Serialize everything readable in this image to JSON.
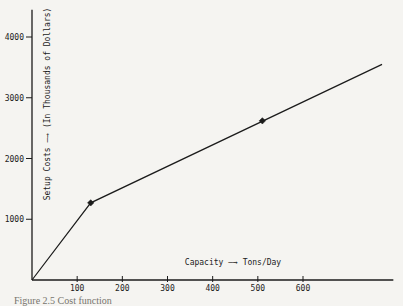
{
  "page": {
    "background": "#f5f4f1",
    "ink": "#1b1b1b"
  },
  "caption": {
    "text": "Figure 2.5 Cost function"
  },
  "chart_data": {
    "type": "line",
    "title": "",
    "xlabel": "Capacity —→ Tons/Day",
    "ylabel": "Setup Costs —→ (In Thousands of Dollars)",
    "x_ticks": [
      100,
      200,
      300,
      400,
      500,
      600
    ],
    "y_ticks": [
      1000,
      2000,
      3000,
      4000
    ],
    "xlim": [
      0,
      800
    ],
    "ylim": [
      0,
      4450
    ],
    "grid": false,
    "legend": null,
    "series": [
      {
        "name": "setup-cost-piecewise-line",
        "points": [
          [
            0,
            0
          ],
          [
            130,
            1270
          ],
          [
            775,
            3550
          ]
        ]
      }
    ],
    "marked_points": [
      [
        130,
        1270
      ],
      [
        510,
        2620
      ]
    ]
  }
}
